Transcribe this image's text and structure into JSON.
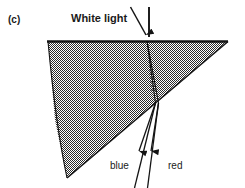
{
  "figure": {
    "panel_letter": "(c)",
    "caption_labels": {
      "incident": "White light",
      "ray_left": "blue",
      "ray_right": "red"
    },
    "colors": {
      "ink": "#1a1a1a",
      "prism_fill": "#8c8c8c",
      "background": "#ffffff"
    },
    "geometry": {
      "prism_vertices": "48,41 228,41 67,178",
      "top_face_y": 41,
      "entry_point": "147,41",
      "exit_point": "157,102",
      "normal_line": "149,8 149,36",
      "incident_ray": "131,8 146,36",
      "blue_exit_ray": "155,103 137,186",
      "red_exit_ray": "159,103 149,186",
      "blue_arrowhead_y": 151,
      "red_arrowhead_y": 151
    }
  }
}
